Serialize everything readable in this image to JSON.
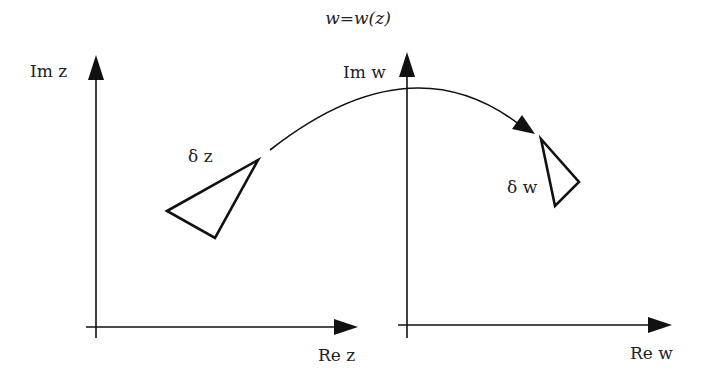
{
  "title": "w=w(z)",
  "z_plane": {
    "imag_axis_label": "Im z",
    "real_axis_label": "Re z",
    "element_label": "δ z"
  },
  "w_plane": {
    "imag_axis_label": "Im w",
    "real_axis_label": "Re w",
    "element_label": "δ w"
  },
  "mapping_arrow": {
    "from": "z-plane",
    "to": "w-plane"
  }
}
